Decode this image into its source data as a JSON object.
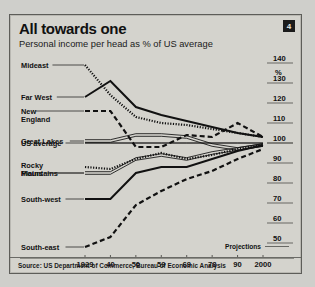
{
  "header": {
    "title": "All towards one",
    "subtitle": "Personal income per head as % of US average",
    "badge": "4"
  },
  "footer": {
    "source": "Source: US Department of Commerce, Bureau of Economic Analysis"
  },
  "annotations": {
    "projections": "Projections",
    "percent_symbol": "%"
  },
  "chart_data": {
    "type": "line",
    "title": "All towards one",
    "subtitle": "Personal income per head as % of US average",
    "xlabel": "",
    "ylabel": "%",
    "x": [
      1929,
      1940,
      1950,
      1959,
      1969,
      1978,
      1990,
      2000
    ],
    "xticklabels": [
      "1929",
      "40",
      "50",
      "59",
      "69",
      "78",
      "90",
      "2000"
    ],
    "ylim": [
      45,
      142
    ],
    "yticks": [
      50,
      60,
      70,
      80,
      90,
      100,
      110,
      120,
      130,
      140
    ],
    "yticklabels": [
      "50",
      "60",
      "70",
      "80",
      "90",
      "100",
      "110",
      "120",
      "130",
      "140"
    ],
    "grid": false,
    "legend": "left-labels",
    "reference_line": {
      "label": "US average",
      "value": 100
    },
    "series": [
      {
        "name": "Mideast",
        "style": "dotted",
        "values": [
          139,
          124,
          113,
          110,
          109,
          107,
          105,
          103
        ]
      },
      {
        "name": "Far West",
        "style": "solid",
        "values": [
          123,
          131,
          118,
          114,
          111,
          108,
          105,
          103
        ]
      },
      {
        "name": "New England",
        "style": "dashed",
        "values": [
          116,
          116,
          98,
          98,
          104,
          103,
          110,
          103
        ]
      },
      {
        "name": "Great Lakes",
        "style": "double",
        "values": [
          101,
          101,
          104,
          104,
          103,
          99,
          97,
          99
        ]
      },
      {
        "name": "US average",
        "style": "thin",
        "values": [
          100,
          100,
          100,
          100,
          100,
          100,
          100,
          100
        ]
      },
      {
        "name": "Rocky Mountains",
        "style": "dotted",
        "values": [
          88,
          87,
          92,
          95,
          92,
          94,
          97,
          99
        ]
      },
      {
        "name": "Plains",
        "style": "double",
        "values": [
          85,
          85,
          92,
          94,
          92,
          95,
          97,
          99
        ]
      },
      {
        "name": "South-west",
        "style": "solid",
        "values": [
          72,
          72,
          85,
          88,
          88,
          92,
          96,
          99
        ]
      },
      {
        "name": "South-east",
        "style": "dashed",
        "values": [
          48,
          53,
          69,
          76,
          82,
          86,
          92,
          97
        ]
      }
    ],
    "series_labels": [
      {
        "name": "Mideast",
        "text": "Mideast"
      },
      {
        "name": "Far West",
        "text": "Far West"
      },
      {
        "name": "New England",
        "text": "New",
        "text2": "England"
      },
      {
        "name": "Great Lakes",
        "text": "Great Lakes"
      },
      {
        "name": "US average",
        "text": "US average"
      },
      {
        "name": "Rocky Mountains",
        "text": "Rocky",
        "text2": "Mountains"
      },
      {
        "name": "Plains",
        "text": "Plains"
      },
      {
        "name": "South-west",
        "text": "South-west"
      },
      {
        "name": "South-east",
        "text": "South-east"
      }
    ]
  }
}
